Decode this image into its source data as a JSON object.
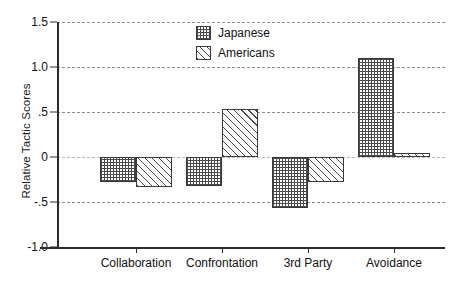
{
  "chart_data": {
    "type": "bar",
    "title": "",
    "xlabel": "",
    "ylabel": "Relative Tactic Scores",
    "categories": [
      "Collaboration",
      "Confrontation",
      "3rd Party",
      "Avoidance"
    ],
    "series": [
      {
        "name": "Japanese",
        "pattern": "crosshatch-grid",
        "values": [
          -0.28,
          -0.32,
          -0.57,
          1.1
        ]
      },
      {
        "name": "Americans",
        "pattern": "diagonal-hatch",
        "values": [
          -0.33,
          0.53,
          -0.28,
          0.05
        ]
      }
    ],
    "ylim": [
      -1.0,
      1.5
    ],
    "yticks": [
      1.5,
      1.0,
      0.5,
      0.0,
      -0.5,
      -1.0
    ],
    "ytick_labels": [
      "1.5",
      "1.0",
      ".5",
      "0",
      "-.5",
      "-1.0"
    ],
    "grid": true,
    "grid_axis": "y",
    "legend_position": "top-center",
    "legend_entries": [
      "Japanese",
      "Americans"
    ],
    "colors": {
      "axis": "#2b2b2b",
      "grid": "#8d8d8d",
      "bar_edge": "#3a3a3a",
      "hatch": "#4a4a4a",
      "background": "#ffffff",
      "text": "#111111"
    }
  }
}
